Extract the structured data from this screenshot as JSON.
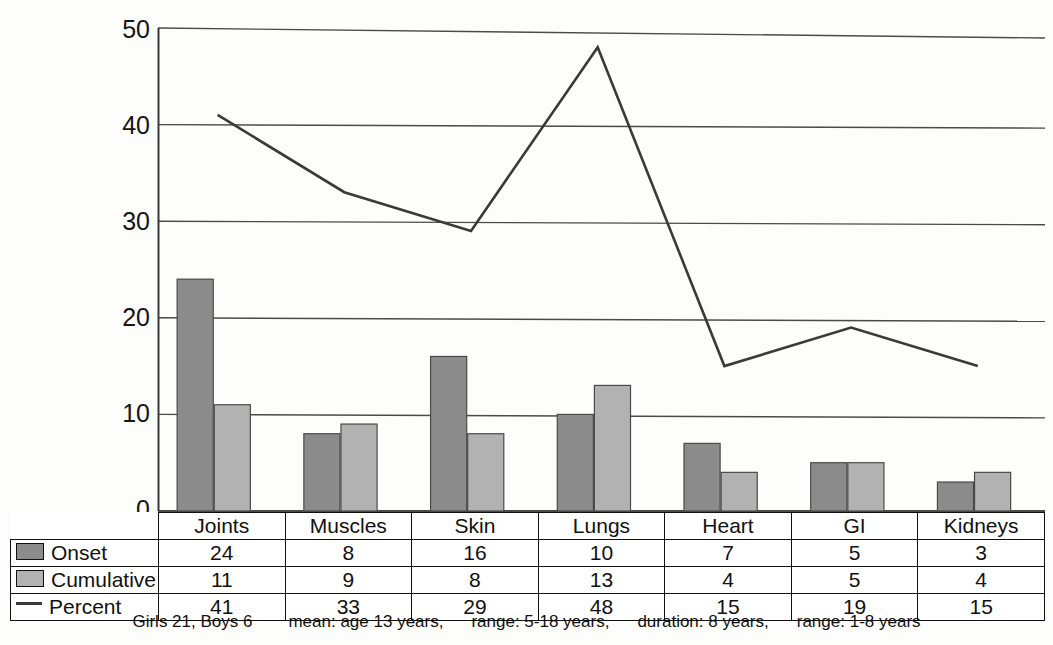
{
  "chart_data": {
    "type": "bar",
    "title": "",
    "subtitle": "",
    "xlabel": "",
    "ylabel": "",
    "ylim": [
      0,
      50
    ],
    "yticks": [
      0,
      10,
      20,
      30,
      40,
      50
    ],
    "grid": true,
    "legend_position": "table-left",
    "categories": [
      "Joints",
      "Muscles",
      "Skin",
      "Lungs",
      "Heart",
      "GI",
      "Kidneys"
    ],
    "series": [
      {
        "name": "Onset",
        "type": "bar",
        "color": "#8b8b8b",
        "values": [
          24,
          8,
          16,
          10,
          7,
          5,
          3
        ]
      },
      {
        "name": "Cumulative",
        "type": "bar",
        "color": "#b2b2b2",
        "values": [
          11,
          9,
          8,
          13,
          4,
          5,
          4
        ]
      },
      {
        "name": "Percent",
        "type": "line",
        "color": "#3a3a3a",
        "values": [
          41,
          33,
          29,
          48,
          15,
          19,
          15
        ]
      }
    ]
  },
  "table": {
    "header_row": [
      "Joints",
      "Muscles",
      "Skin",
      "Lungs",
      "Heart",
      "GI",
      "Kidneys"
    ],
    "rows": [
      {
        "legend_label": "Onset",
        "legend_icon": "dark-square-swatch",
        "values": [
          "24",
          "8",
          "16",
          "10",
          "7",
          "5",
          "3"
        ]
      },
      {
        "legend_label": "Cumulative",
        "legend_icon": "light-square-swatch",
        "values": [
          "11",
          "9",
          "8",
          "13",
          "4",
          "5",
          "4"
        ]
      },
      {
        "legend_label": "Percent",
        "legend_icon": "line-dash-swatch",
        "values": [
          "41",
          "33",
          "29",
          "48",
          "15",
          "19",
          "15"
        ]
      }
    ]
  },
  "axis": {
    "y_tick_labels": [
      "50",
      "40",
      "30",
      "20",
      "10",
      "0"
    ]
  },
  "footnote": {
    "part1": "Girls 21, Boys 6",
    "part2": "mean: age 13 years,",
    "part3": "range: 5-18 years,",
    "part4": "duration: 8 years,",
    "part5": "range: 1-8 years"
  },
  "colors": {
    "onset_bar": "#8b8b8b",
    "cumulative_bar": "#b2b2b2",
    "percent_line": "#3a3a3a",
    "grid": "#4a4a4a",
    "text": "#111111"
  }
}
